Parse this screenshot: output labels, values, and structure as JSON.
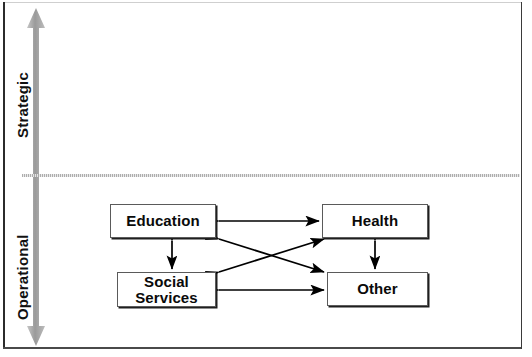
{
  "diagram": {
    "title_visible": false,
    "axis": {
      "name": "vertical-scale-arrow",
      "top_label": "Strategic",
      "bottom_label": "Operational",
      "arrow_style": "double-headed",
      "arrow_color": "#9a9a9a",
      "divider_style": "dotted",
      "divider_color": "#a9a9a9"
    },
    "nodes": [
      {
        "id": "education",
        "label": "Education",
        "quadrant": "Operational"
      },
      {
        "id": "social_services",
        "label": "Social\nServices",
        "quadrant": "Operational"
      },
      {
        "id": "health",
        "label": "Health",
        "quadrant": "Operational"
      },
      {
        "id": "other",
        "label": "Other",
        "quadrant": "Operational"
      }
    ],
    "connections": [
      {
        "from": "education",
        "to": "health",
        "type": "double-headed"
      },
      {
        "from": "education",
        "to": "social_services",
        "type": "double-headed"
      },
      {
        "from": "education",
        "to": "other",
        "type": "double-headed"
      },
      {
        "from": "social_services",
        "to": "health",
        "type": "double-headed"
      },
      {
        "from": "social_services",
        "to": "other",
        "type": "double-headed"
      },
      {
        "from": "health",
        "to": "other",
        "type": "double-headed"
      }
    ],
    "colors": {
      "line": "#000000",
      "box_border": "#5a5a5a",
      "box_shadow": "#1f1f1f",
      "text": "#0a0a0a",
      "frame": "#2b2b2b",
      "background": "#ffffff"
    }
  }
}
